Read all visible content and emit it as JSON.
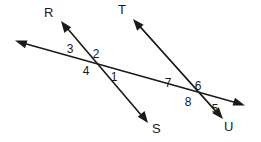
{
  "figure": {
    "type": "geometry-diagram",
    "background_color": "#ffffff",
    "line_color": "#1a1a1a",
    "width": 261,
    "height": 142
  },
  "point_labels": [
    {
      "id": "R",
      "text": "R",
      "x": 44,
      "y": 17
    },
    {
      "id": "T",
      "text": "T",
      "x": 118,
      "y": 14
    },
    {
      "id": "S",
      "text": "S",
      "x": 152,
      "y": 133
    },
    {
      "id": "U",
      "text": "U",
      "x": 224,
      "y": 131
    }
  ],
  "angle_labels": [
    {
      "id": "1",
      "text": "1",
      "x": 114,
      "y": 81
    },
    {
      "id": "2",
      "text": "2",
      "x": 96,
      "y": 58
    },
    {
      "id": "3",
      "text": "3",
      "x": 70,
      "y": 53
    },
    {
      "id": "4",
      "text": "4",
      "x": 86,
      "y": 75
    },
    {
      "id": "5",
      "text": "5",
      "x": 215,
      "y": 113
    },
    {
      "id": "6",
      "text": "6",
      "x": 198,
      "y": 90
    },
    {
      "id": "7",
      "text": "7",
      "x": 168,
      "y": 87
    },
    {
      "id": "8",
      "text": "8",
      "x": 188,
      "y": 106
    }
  ],
  "lines": [
    {
      "id": "transversal",
      "name": "double-arrow-transversal",
      "from": {
        "x": 16,
        "y": 41
      },
      "to": {
        "x": 244,
        "y": 105
      },
      "arrow_start": true,
      "arrow_end": true
    },
    {
      "id": "RS",
      "name": "line-R-to-S",
      "from": {
        "x": 62,
        "y": 22
      },
      "to": {
        "x": 147,
        "y": 122
      },
      "arrow_start": true,
      "arrow_end": true
    },
    {
      "id": "TU",
      "name": "line-T-to-U",
      "from": {
        "x": 134,
        "y": 20
      },
      "to": {
        "x": 222,
        "y": 118
      },
      "arrow_start": true,
      "arrow_end": true
    }
  ],
  "intersections": [
    {
      "id": "left",
      "x": 98,
      "y": 63
    },
    {
      "id": "right",
      "x": 199,
      "y": 93
    }
  ]
}
